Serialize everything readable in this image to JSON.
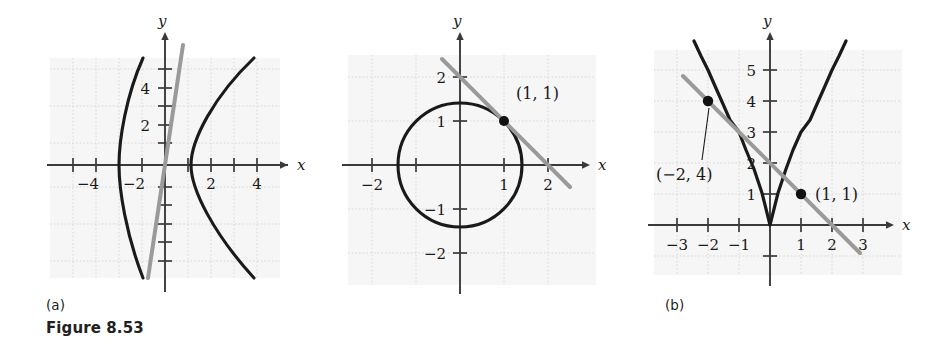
{
  "figure": {
    "caption": "Figure 8.53",
    "panel_labels": [
      "(a)",
      "(b)",
      "(c)"
    ]
  },
  "colors": {
    "curve": "#1a1a1a",
    "line": "#9a9a9a",
    "axis": "#3a3a3a",
    "grid": "#cfcfcf",
    "plot_bg": "#f6f6f6",
    "page_bg": "#ffffff",
    "point": "#111111"
  },
  "panel_a": {
    "label": "(a)",
    "axis_labels": {
      "x": "x",
      "y": "y"
    },
    "x_ticks": [
      -5,
      -4,
      -3,
      -2,
      -1,
      1,
      2,
      3,
      4,
      5
    ],
    "x_tick_labels": [
      {
        "value": -4,
        "text": "−4"
      },
      {
        "value": -2,
        "text": "−2"
      },
      {
        "value": 2,
        "text": "2"
      },
      {
        "value": 4,
        "text": "4"
      }
    ],
    "y_ticks": [
      -6,
      -5,
      -4,
      -3,
      -2,
      -1,
      1,
      2,
      3,
      4,
      5,
      6
    ],
    "y_tick_labels": [
      {
        "value": 4,
        "text": "4"
      },
      {
        "value": 2,
        "text": "2"
      }
    ],
    "xlim": [
      -6.2,
      6.2
    ],
    "ylim": [
      -6.6,
      6.6
    ],
    "grid": true,
    "curves": [
      {
        "name": "hyperbola-right-branch",
        "color": "curve"
      },
      {
        "name": "hyperbola-left-branch",
        "color": "curve"
      },
      {
        "name": "steep-gray-line",
        "color": "line"
      }
    ]
  },
  "panel_b": {
    "label": "(b)",
    "axis_labels": {
      "x": "x",
      "y": "y"
    },
    "x_ticks": [
      -2,
      -1,
      1,
      2
    ],
    "x_tick_labels": [
      {
        "value": -2,
        "text": "−2"
      },
      {
        "value": 1,
        "text": "1"
      },
      {
        "value": 2,
        "text": "2"
      }
    ],
    "y_ticks": [
      -2,
      -1,
      1,
      2
    ],
    "y_tick_labels": [
      {
        "value": 2,
        "text": "2"
      },
      {
        "value": 1,
        "text": "1"
      },
      {
        "value": -1,
        "text": "−1"
      },
      {
        "value": -2,
        "text": "−2"
      }
    ],
    "xlim": [
      -2.6,
      2.6
    ],
    "ylim": [
      -2.7,
      2.7
    ],
    "grid": true,
    "circle": {
      "center": [
        0,
        0
      ],
      "radius": 1.414
    },
    "tangent_line": {
      "slope": -1,
      "intercept": 2
    },
    "points": [
      {
        "x": 1,
        "y": 1,
        "label": "(1, 1)"
      }
    ]
  },
  "panel_c": {
    "label": "(c)",
    "axis_labels": {
      "x": "x",
      "y": "y"
    },
    "x_ticks": [
      -3,
      -2,
      -1,
      1,
      2,
      3
    ],
    "x_tick_labels": [
      {
        "value": -3,
        "text": "−3"
      },
      {
        "value": -2,
        "text": "−2"
      },
      {
        "value": -1,
        "text": "−1"
      },
      {
        "value": 1,
        "text": "1"
      },
      {
        "value": 2,
        "text": "2"
      },
      {
        "value": 3,
        "text": "3"
      }
    ],
    "y_ticks": [
      -1,
      1,
      2,
      3,
      4,
      5
    ],
    "y_tick_labels": [
      {
        "value": 5,
        "text": "5"
      },
      {
        "value": 4,
        "text": "4"
      },
      {
        "value": 3,
        "text": "3"
      },
      {
        "value": 2,
        "text": "2"
      },
      {
        "value": 1,
        "text": "1"
      }
    ],
    "xlim": [
      -3.7,
      3.7
    ],
    "ylim": [
      -1.4,
      6.2
    ],
    "grid": true,
    "parabola": {
      "equation": "y = x^2"
    },
    "secant_line": {
      "slope": -1,
      "intercept": 2
    },
    "points": [
      {
        "x": -2,
        "y": 4,
        "label": "(−2, 4)",
        "leader": true
      },
      {
        "x": 1,
        "y": 1,
        "label": "(1, 1)",
        "leader": false
      }
    ]
  }
}
